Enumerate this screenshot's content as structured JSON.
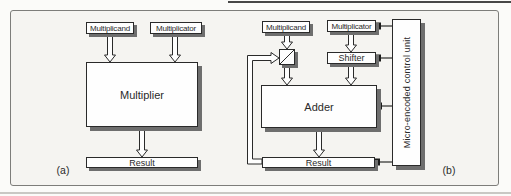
{
  "figure": {
    "panel_a": {
      "label": "(a)",
      "blocks": {
        "multiplicand": "Multiplicand",
        "multiplicator": "Multiplicator",
        "multiplier": "Multiplier",
        "result": "Result"
      }
    },
    "panel_b": {
      "label": "(b)",
      "blocks": {
        "multiplicand": "Multiplicand",
        "multiplicator": "Multiplicator",
        "shifter": "Shifter",
        "adder": "Adder",
        "result": "Result",
        "control_unit": "Micro-encoded control unit"
      }
    },
    "colors": {
      "paper": "#f5f4f1",
      "box_fill": "#fefefe",
      "box_border": "#2a2a2a",
      "shadow": "#6e6e6e",
      "frame": "#7d7d7a",
      "connector": "#1c1c1c"
    }
  }
}
